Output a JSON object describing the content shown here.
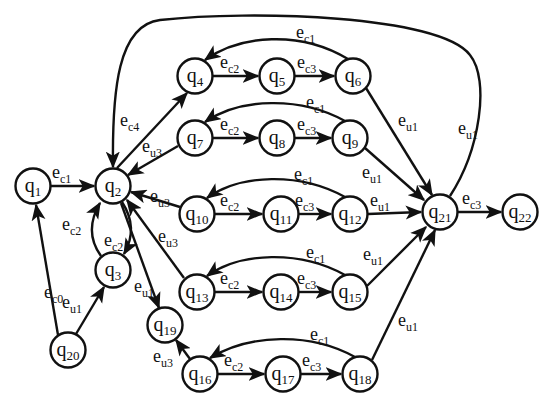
{
  "diagram": {
    "type": "state-transition-graph",
    "nodes": [
      {
        "id": "q1",
        "base": "q",
        "sub": "1",
        "x": 33,
        "y": 186
      },
      {
        "id": "q2",
        "base": "q",
        "sub": "2",
        "x": 113,
        "y": 186
      },
      {
        "id": "q3",
        "base": "q",
        "sub": "3",
        "x": 113,
        "y": 270
      },
      {
        "id": "q4",
        "base": "q",
        "sub": "4",
        "x": 195,
        "y": 76
      },
      {
        "id": "q5",
        "base": "q",
        "sub": "5",
        "x": 277,
        "y": 76
      },
      {
        "id": "q6",
        "base": "q",
        "sub": "6",
        "x": 353,
        "y": 76
      },
      {
        "id": "q7",
        "base": "q",
        "sub": "7",
        "x": 195,
        "y": 138
      },
      {
        "id": "q8",
        "base": "q",
        "sub": "8",
        "x": 277,
        "y": 138
      },
      {
        "id": "q9",
        "base": "q",
        "sub": "9",
        "x": 350,
        "y": 138
      },
      {
        "id": "q10",
        "base": "q",
        "sub": "10",
        "x": 197,
        "y": 214
      },
      {
        "id": "q11",
        "base": "q",
        "sub": "11",
        "x": 281,
        "y": 214
      },
      {
        "id": "q12",
        "base": "q",
        "sub": "12",
        "x": 350,
        "y": 214
      },
      {
        "id": "q13",
        "base": "q",
        "sub": "13",
        "x": 197,
        "y": 292
      },
      {
        "id": "q14",
        "base": "q",
        "sub": "14",
        "x": 281,
        "y": 292
      },
      {
        "id": "q15",
        "base": "q",
        "sub": "15",
        "x": 350,
        "y": 292
      },
      {
        "id": "q16",
        "base": "q",
        "sub": "16",
        "x": 200,
        "y": 374
      },
      {
        "id": "q17",
        "base": "q",
        "sub": "17",
        "x": 283,
        "y": 374
      },
      {
        "id": "q18",
        "base": "q",
        "sub": "18",
        "x": 360,
        "y": 374
      },
      {
        "id": "q19",
        "base": "q",
        "sub": "19",
        "x": 165,
        "y": 325
      },
      {
        "id": "q20",
        "base": "q",
        "sub": "20",
        "x": 68,
        "y": 350
      },
      {
        "id": "q21",
        "base": "q",
        "sub": "21",
        "x": 440,
        "y": 212
      },
      {
        "id": "q22",
        "base": "q",
        "sub": "22",
        "x": 520,
        "y": 212
      }
    ],
    "edges": [
      {
        "from": "q1",
        "to": "q2",
        "base": "e",
        "sub": "c1",
        "path": "M51,186 L94,186",
        "lx": 52,
        "ly": 178
      },
      {
        "from": "q2",
        "to": "q3",
        "base": "e",
        "sub": "c2",
        "path": "M122,202 C135,222 132,240 124,254",
        "lx": 104,
        "ly": 246
      },
      {
        "from": "q3",
        "to": "q2",
        "base": "e",
        "sub": "c2",
        "path": "M101,256 C88,238 90,220 100,203",
        "lx": 62,
        "ly": 230
      },
      {
        "from": "q20",
        "to": "q1",
        "base": "e",
        "sub": "c0",
        "path": "M58,335 L36,205",
        "lx": 44,
        "ly": 298
      },
      {
        "from": "q20",
        "to": "q3",
        "base": "e",
        "sub": "u1",
        "path": "M76,334 L104,287",
        "lx": 62,
        "ly": 308
      },
      {
        "from": "q2",
        "to": "q4",
        "base": "e",
        "sub": "c4",
        "path": "M117,168 L187,93",
        "lx": 120,
        "ly": 126
      },
      {
        "from": "q7",
        "to": "q2",
        "base": "e",
        "sub": "u3",
        "path": "M178,146 L128,175",
        "lx": 142,
        "ly": 152
      },
      {
        "from": "q10",
        "to": "q2",
        "base": "e",
        "sub": "u3",
        "path": "M180,207 L131,192",
        "lx": 150,
        "ly": 202
      },
      {
        "from": "q13",
        "to": "q2",
        "base": "e",
        "sub": "u3",
        "path": "M184,278 L127,200",
        "lx": 158,
        "ly": 242
      },
      {
        "from": "q2",
        "to": "q19",
        "base": "e",
        "sub": "u1",
        "path": "M121,203 L159,308",
        "lx": 134,
        "ly": 292
      },
      {
        "from": "q16",
        "to": "q19",
        "base": "e",
        "sub": "u3",
        "path": "M190,359 L176,340",
        "lx": 153,
        "ly": 362
      },
      {
        "from": "q4",
        "to": "q5",
        "base": "e",
        "sub": "c2",
        "path": "M213,76 L258,76",
        "lx": 220,
        "ly": 68
      },
      {
        "from": "q5",
        "to": "q6",
        "base": "e",
        "sub": "c3",
        "path": "M295,76 L334,76",
        "lx": 297,
        "ly": 68
      },
      {
        "from": "q6",
        "to": "q4",
        "base": "e",
        "sub": "c1",
        "path": "M348,59 C300,30 240,35 205,60",
        "lx": 296,
        "ly": 38
      },
      {
        "from": "q7",
        "to": "q8",
        "base": "e",
        "sub": "c2",
        "path": "M213,138 L258,138",
        "lx": 220,
        "ly": 130
      },
      {
        "from": "q8",
        "to": "q9",
        "base": "e",
        "sub": "c3",
        "path": "M295,138 L331,138",
        "lx": 297,
        "ly": 130
      },
      {
        "from": "q9",
        "to": "q7",
        "base": "e",
        "sub": "c1",
        "path": "M345,121 C300,96 240,98 205,122",
        "lx": 306,
        "ly": 108
      },
      {
        "from": "q10",
        "to": "q11",
        "base": "e",
        "sub": "c2",
        "path": "M215,214 L262,214",
        "lx": 220,
        "ly": 206
      },
      {
        "from": "q11",
        "to": "q12",
        "base": "e",
        "sub": "c3",
        "path": "M299,214 L331,214",
        "lx": 295,
        "ly": 206
      },
      {
        "from": "q12",
        "to": "q10",
        "base": "e",
        "sub": "c1",
        "path": "M345,197 C300,172 240,174 207,198",
        "lx": 294,
        "ly": 180
      },
      {
        "from": "q13",
        "to": "q14",
        "base": "e",
        "sub": "c2",
        "path": "M215,292 L262,292",
        "lx": 220,
        "ly": 284
      },
      {
        "from": "q14",
        "to": "q15",
        "base": "e",
        "sub": "c3",
        "path": "M299,292 L331,292",
        "lx": 297,
        "ly": 284
      },
      {
        "from": "q15",
        "to": "q13",
        "base": "e",
        "sub": "c1",
        "path": "M345,275 C300,250 240,252 207,276",
        "lx": 306,
        "ly": 258
      },
      {
        "from": "q16",
        "to": "q17",
        "base": "e",
        "sub": "c2",
        "path": "M218,374 L264,374",
        "lx": 224,
        "ly": 366
      },
      {
        "from": "q17",
        "to": "q18",
        "base": "e",
        "sub": "c3",
        "path": "M301,374 L341,374",
        "lx": 302,
        "ly": 366
      },
      {
        "from": "q18",
        "to": "q16",
        "base": "e",
        "sub": "c1",
        "path": "M355,357 C310,332 250,334 210,358",
        "lx": 310,
        "ly": 340
      },
      {
        "from": "q6",
        "to": "q21",
        "base": "e",
        "sub": "u1",
        "path": "M366,88 L432,195",
        "lx": 398,
        "ly": 126
      },
      {
        "from": "q9",
        "to": "q21",
        "base": "e",
        "sub": "u1",
        "path": "M365,148 L424,200",
        "lx": 362,
        "ly": 178
      },
      {
        "from": "q12",
        "to": "q21",
        "base": "e",
        "sub": "u1",
        "path": "M368,214 L421,212",
        "lx": 370,
        "ly": 206
      },
      {
        "from": "q15",
        "to": "q21",
        "base": "e",
        "sub": "u1",
        "path": "M367,286 L426,227",
        "lx": 363,
        "ly": 260
      },
      {
        "from": "q18",
        "to": "q21",
        "base": "e",
        "sub": "u1",
        "path": "M372,360 L435,230",
        "lx": 398,
        "ly": 326
      },
      {
        "from": "q21",
        "to": "q22",
        "base": "e",
        "sub": "c3",
        "path": "M458,212 L501,212",
        "lx": 462,
        "ly": 204
      },
      {
        "from": "q21",
        "to": "q2",
        "base": "e",
        "sub": "u1",
        "path": "M450,196 C480,150 490,80 470,55 C440,15 250,10 160,20 C118,25 112,90 113,167",
        "lx": 458,
        "ly": 134
      }
    ]
  }
}
